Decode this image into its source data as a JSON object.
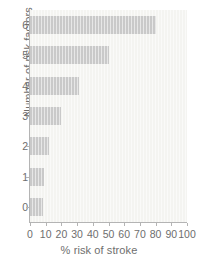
{
  "chart_data": {
    "type": "bar",
    "orientation": "horizontal",
    "title": "",
    "xlabel": "% risk of stroke",
    "ylabel": "Number of risk factors",
    "categories": [
      "0",
      "1",
      "2",
      "3",
      "4",
      "5",
      "6"
    ],
    "values": [
      8,
      9,
      12,
      20,
      31,
      50,
      80
    ],
    "xlim": [
      0,
      100
    ],
    "xticks": [
      "0",
      "10",
      "20",
      "30",
      "40",
      "50",
      "60",
      "70",
      "80",
      "90",
      "100"
    ],
    "xtick_values": [
      0,
      10,
      20,
      30,
      40,
      50,
      60,
      70,
      80,
      90,
      100
    ],
    "yticks": [
      "0",
      "1",
      "2",
      "3",
      "4",
      "5",
      "6"
    ],
    "grid": false,
    "legend": null,
    "colors": {
      "bar": "#c9c9c9",
      "plot_background": "#f4f4f1",
      "axis": "#b4b4b4",
      "text": "#6e6e6e",
      "figure_background": "#ffffff"
    }
  }
}
